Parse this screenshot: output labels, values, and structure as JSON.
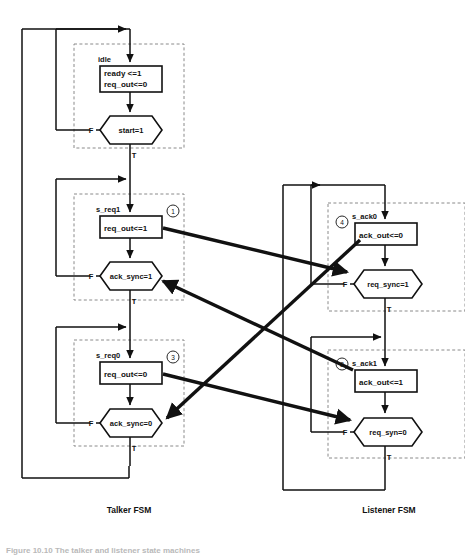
{
  "figure": {
    "caption_left": "Talker FSM",
    "caption_right": "Listener FSM",
    "caption_bottom": "Figure 10.10  The talker and listener state machines"
  },
  "colors": {
    "ink": "#111111",
    "dashed_border": "#8a8a8a",
    "paper": "#ffffff",
    "faded_caption": "#b9b9b9"
  },
  "talker": {
    "name": "Talker FSM",
    "states": [
      {
        "id": "idle",
        "name": "idle",
        "actions": [
          "ready <=1",
          "req_out<=0"
        ],
        "condition": "start=1",
        "false_label": "F",
        "true_label": "T"
      },
      {
        "id": "s_req1",
        "name": "s_req1",
        "actions": [
          "req_out<=1"
        ],
        "condition": "ack_sync=1",
        "false_label": "F",
        "true_label": "T",
        "marker": "1"
      },
      {
        "id": "s_req0",
        "name": "s_req0",
        "actions": [
          "req_out<=0"
        ],
        "condition": "ack_sync=0",
        "false_label": "F",
        "true_label": "T",
        "marker": "3"
      }
    ]
  },
  "listener": {
    "name": "Listener FSM",
    "states": [
      {
        "id": "s_ack0",
        "name": "s_ack0",
        "actions": [
          "ack_out<=0"
        ],
        "condition": "req_sync=1",
        "false_label": "F",
        "true_label": "T",
        "marker": "4"
      },
      {
        "id": "s_ack1",
        "name": "s_ack1",
        "actions": [
          "ack_out<=1"
        ],
        "condition": "req_syn=0",
        "false_label": "F",
        "true_label": "T",
        "marker": "2"
      }
    ]
  },
  "signal_arrows": [
    {
      "id": "arrow-1",
      "marker": "1",
      "from": "talker.s_req1.req_out",
      "to": "listener.s_ack0.req_sync"
    },
    {
      "id": "arrow-2",
      "marker": "2",
      "from": "listener.s_ack1.ack_out",
      "to": "talker.s_req1.ack_sync"
    },
    {
      "id": "arrow-3",
      "marker": "3",
      "from": "talker.s_req0.req_out",
      "to": "listener.s_ack1.req_syn"
    },
    {
      "id": "arrow-4",
      "marker": "4",
      "from": "listener.s_ack0.ack_out",
      "to": "talker.s_req0.ack_sync"
    }
  ]
}
